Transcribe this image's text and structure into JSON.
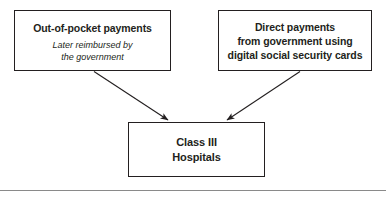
{
  "diagram": {
    "nodes": {
      "out_of_pocket": {
        "title": "Out-of-pocket payments",
        "subtitle": "Later reimbursed by\nthe government"
      },
      "direct_payments": {
        "title": "Direct payments\nfrom government using\ndigital social security cards"
      },
      "class_iii_hospitals": {
        "title": "Class III\nHospitals"
      }
    },
    "edges": [
      {
        "name": "out-of-pocket-to-hospitals",
        "from": "out_of_pocket",
        "to": "class_iii_hospitals"
      },
      {
        "name": "direct-payments-to-hospitals",
        "from": "direct_payments",
        "to": "class_iii_hospitals"
      }
    ],
    "colors": {
      "box_border": "#231f20",
      "text": "#231f20",
      "arrow": "#231f20",
      "background": "#ffffff",
      "rule": "#8a8a8a"
    }
  }
}
